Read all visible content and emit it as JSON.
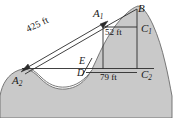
{
  "figure": {
    "colors": {
      "terrain_fill": "#c9c9c9",
      "terrain_stroke": "#6b6b6b",
      "line": "#2b2b2b",
      "label": "#1a1a1a",
      "background": "#ffffff"
    },
    "points": [
      {
        "id": "A1",
        "label": "A",
        "subscript": "1",
        "x": 93,
        "y": 8
      },
      {
        "id": "A2",
        "label": "A",
        "subscript": "2",
        "x": 12,
        "y": 75
      },
      {
        "id": "B",
        "label": "B",
        "subscript": "",
        "x": 138,
        "y": 3
      },
      {
        "id": "C1",
        "label": "C",
        "subscript": "1",
        "x": 141,
        "y": 23
      },
      {
        "id": "C2",
        "label": "C",
        "subscript": "2",
        "x": 141,
        "y": 69
      },
      {
        "id": "D",
        "label": "D",
        "subscript": "",
        "x": 77,
        "y": 68
      },
      {
        "id": "E",
        "label": "E",
        "subscript": "",
        "x": 79,
        "y": 56
      }
    ],
    "dimensions": [
      {
        "id": "span",
        "value": "425",
        "unit": "ft",
        "text": "425 ft",
        "orientation": "diagonal"
      },
      {
        "id": "height",
        "value": "52",
        "unit": "ft",
        "text": "52 ft",
        "orientation": "horizontal"
      },
      {
        "id": "base",
        "value": "79",
        "unit": "ft",
        "text": "79 ft",
        "orientation": "horizontal"
      }
    ]
  }
}
